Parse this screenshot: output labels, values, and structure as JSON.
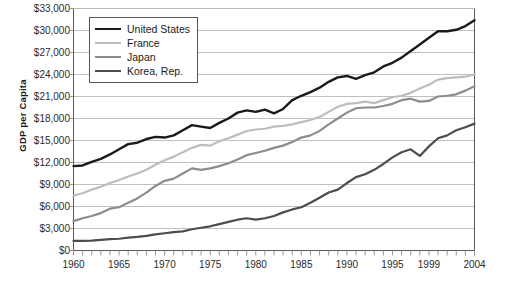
{
  "chart_data": {
    "type": "line",
    "title": "",
    "xlabel": "",
    "ylabel": "GDP per Capita",
    "xlim": [
      1960,
      2004
    ],
    "ylim": [
      0,
      33000
    ],
    "ytick_step": 3000,
    "grid": true,
    "legend_position": "top-left",
    "ytick_labels": [
      "$33,000",
      "$30,000",
      "$27,000",
      "$24,000",
      "$21,000",
      "$18,000",
      "$15,000",
      "$12,000",
      "$9,000",
      "$6,000",
      "$3,000",
      "$0"
    ],
    "ytick_values": [
      33000,
      30000,
      27000,
      24000,
      21000,
      18000,
      15000,
      12000,
      9000,
      6000,
      3000,
      0
    ],
    "xtick_labels": [
      "1960",
      "1965",
      "1970",
      "1975",
      "1980",
      "1985",
      "1990",
      "1995",
      "1999",
      "2004"
    ],
    "xtick_values": [
      1960,
      1965,
      1970,
      1975,
      1980,
      1985,
      1990,
      1995,
      1999,
      2004
    ],
    "x": [
      1960,
      1961,
      1962,
      1963,
      1964,
      1965,
      1966,
      1967,
      1968,
      1969,
      1970,
      1971,
      1972,
      1973,
      1974,
      1975,
      1976,
      1977,
      1978,
      1979,
      1980,
      1981,
      1982,
      1983,
      1984,
      1985,
      1986,
      1987,
      1988,
      1989,
      1990,
      1991,
      1992,
      1993,
      1994,
      1995,
      1996,
      1997,
      1998,
      1999,
      2000,
      2001,
      2002,
      2003,
      2004
    ],
    "series": [
      {
        "name": "United States",
        "color": "#1a1a1a",
        "width": 2.4,
        "values": [
          11500,
          11600,
          12100,
          12500,
          13100,
          13800,
          14500,
          14700,
          15200,
          15500,
          15400,
          15700,
          16400,
          17100,
          16900,
          16700,
          17400,
          18000,
          18800,
          19100,
          18900,
          19200,
          18700,
          19300,
          20500,
          21100,
          21600,
          22200,
          23000,
          23600,
          23800,
          23400,
          23900,
          24300,
          25100,
          25600,
          26300,
          27200,
          28100,
          29000,
          29900,
          29900,
          30100,
          30600,
          31400
        ]
      },
      {
        "name": "France",
        "color": "#bdbdbd",
        "width": 2.2,
        "values": [
          7500,
          7800,
          8300,
          8700,
          9200,
          9600,
          10100,
          10500,
          11000,
          11700,
          12300,
          12800,
          13400,
          14000,
          14400,
          14300,
          14900,
          15300,
          15800,
          16300,
          16500,
          16600,
          16900,
          17000,
          17200,
          17500,
          17800,
          18200,
          18900,
          19600,
          20000,
          20100,
          20300,
          20100,
          20500,
          20900,
          21100,
          21500,
          22100,
          22600,
          23300,
          23500,
          23600,
          23700,
          24000
        ]
      },
      {
        "name": "Japan",
        "color": "#8c8c8c",
        "width": 2.2,
        "values": [
          4000,
          4400,
          4700,
          5100,
          5700,
          5900,
          6500,
          7100,
          7900,
          8800,
          9500,
          9800,
          10500,
          11200,
          11000,
          11200,
          11500,
          11900,
          12400,
          13000,
          13300,
          13600,
          14000,
          14300,
          14800,
          15400,
          15700,
          16300,
          17200,
          18000,
          18800,
          19400,
          19500,
          19500,
          19700,
          20000,
          20500,
          20700,
          20300,
          20400,
          21000,
          21100,
          21300,
          21800,
          22400
        ]
      },
      {
        "name": "Korea, Rep.",
        "color": "#4d4d4d",
        "width": 2.2,
        "values": [
          1300,
          1300,
          1350,
          1450,
          1550,
          1600,
          1750,
          1850,
          2000,
          2200,
          2350,
          2500,
          2600,
          2900,
          3100,
          3300,
          3600,
          3900,
          4200,
          4400,
          4200,
          4400,
          4700,
          5200,
          5600,
          5900,
          6500,
          7200,
          7900,
          8300,
          9200,
          10000,
          10400,
          11000,
          11800,
          12700,
          13400,
          13800,
          12900,
          14200,
          15300,
          15700,
          16400,
          16800,
          17300
        ]
      }
    ]
  },
  "legend": {
    "items": [
      {
        "label": "United States"
      },
      {
        "label": "France"
      },
      {
        "label": "Japan"
      },
      {
        "label": "Korea, Rep."
      }
    ]
  }
}
